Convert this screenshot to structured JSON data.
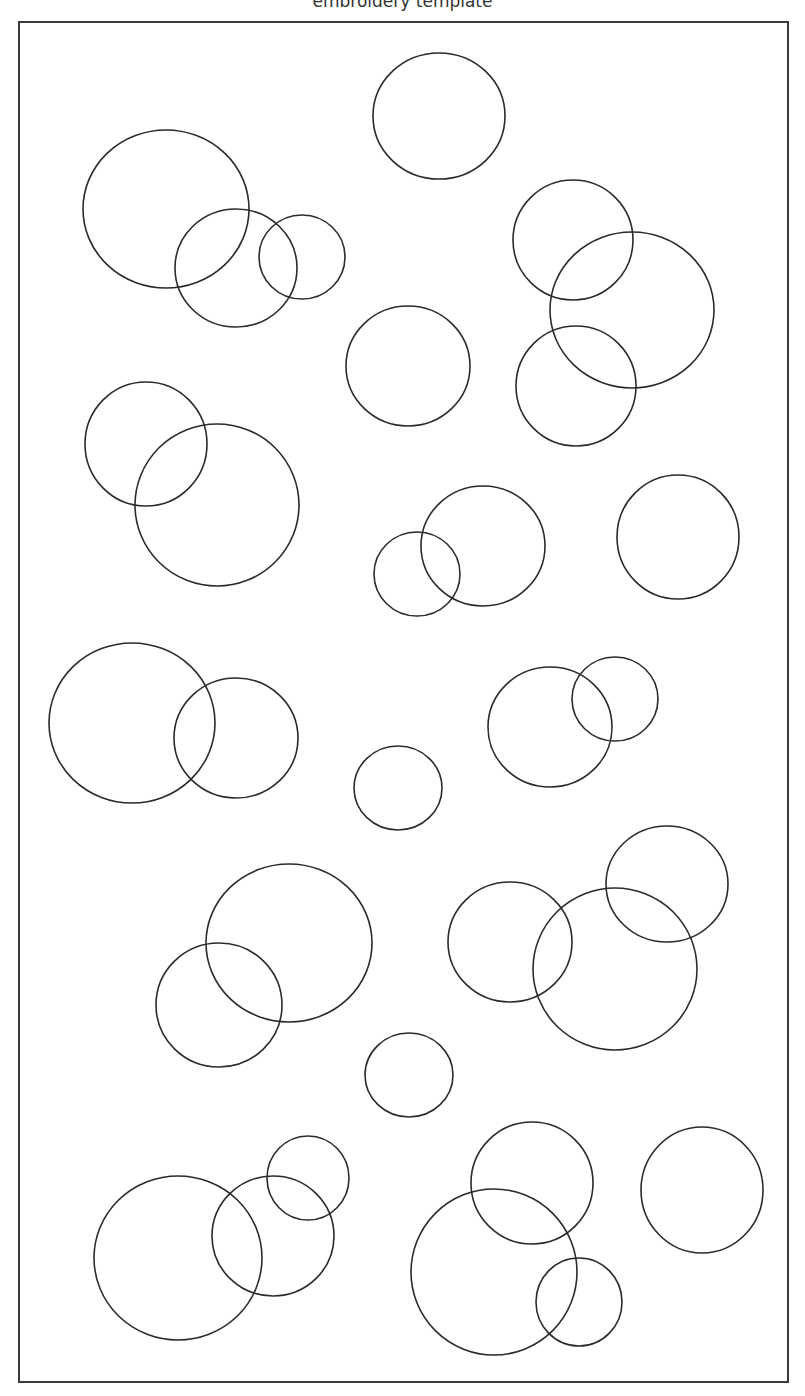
{
  "title": "embroidery template",
  "colors": {
    "stroke": "#2b2b2b",
    "border": "#3a3a3a",
    "background": "#ffffff"
  },
  "circles": [
    {
      "cx": 439,
      "cy": 116,
      "rx": 66,
      "ry": 63
    },
    {
      "cx": 166,
      "cy": 209,
      "rx": 83,
      "ry": 79
    },
    {
      "cx": 236,
      "cy": 268,
      "rx": 61,
      "ry": 59
    },
    {
      "cx": 302,
      "cy": 257,
      "rx": 43,
      "ry": 42
    },
    {
      "cx": 573,
      "cy": 240,
      "rx": 60,
      "ry": 60
    },
    {
      "cx": 632,
      "cy": 310,
      "rx": 82,
      "ry": 78
    },
    {
      "cx": 576,
      "cy": 386,
      "rx": 60,
      "ry": 60
    },
    {
      "cx": 408,
      "cy": 366,
      "rx": 62,
      "ry": 60
    },
    {
      "cx": 146,
      "cy": 444,
      "rx": 61,
      "ry": 62
    },
    {
      "cx": 217,
      "cy": 505,
      "rx": 82,
      "ry": 81
    },
    {
      "cx": 417,
      "cy": 574,
      "rx": 43,
      "ry": 42
    },
    {
      "cx": 483,
      "cy": 546,
      "rx": 62,
      "ry": 60
    },
    {
      "cx": 678,
      "cy": 537,
      "rx": 61,
      "ry": 62
    },
    {
      "cx": 132,
      "cy": 723,
      "rx": 83,
      "ry": 80
    },
    {
      "cx": 236,
      "cy": 738,
      "rx": 62,
      "ry": 60
    },
    {
      "cx": 398,
      "cy": 788,
      "rx": 44,
      "ry": 42
    },
    {
      "cx": 550,
      "cy": 727,
      "rx": 62,
      "ry": 60
    },
    {
      "cx": 615,
      "cy": 699,
      "rx": 43,
      "ry": 42
    },
    {
      "cx": 289,
      "cy": 943,
      "rx": 83,
      "ry": 79
    },
    {
      "cx": 219,
      "cy": 1005,
      "rx": 63,
      "ry": 62
    },
    {
      "cx": 510,
      "cy": 942,
      "rx": 62,
      "ry": 60
    },
    {
      "cx": 615,
      "cy": 969,
      "rx": 82,
      "ry": 81
    },
    {
      "cx": 667,
      "cy": 884,
      "rx": 61,
      "ry": 58
    },
    {
      "cx": 409,
      "cy": 1075,
      "rx": 44,
      "ry": 42
    },
    {
      "cx": 178,
      "cy": 1258,
      "rx": 84,
      "ry": 82
    },
    {
      "cx": 273,
      "cy": 1236,
      "rx": 61,
      "ry": 60
    },
    {
      "cx": 308,
      "cy": 1178,
      "rx": 41,
      "ry": 42
    },
    {
      "cx": 532,
      "cy": 1183,
      "rx": 61,
      "ry": 61
    },
    {
      "cx": 494,
      "cy": 1272,
      "rx": 83,
      "ry": 83
    },
    {
      "cx": 579,
      "cy": 1302,
      "rx": 43,
      "ry": 44
    },
    {
      "cx": 702,
      "cy": 1190,
      "rx": 61,
      "ry": 63
    }
  ]
}
